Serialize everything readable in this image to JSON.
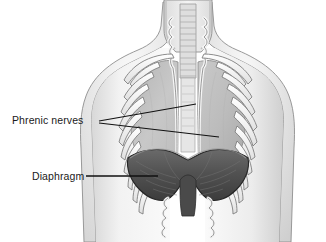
{
  "figure": {
    "background_color": "#ffffff",
    "width": 326,
    "height": 242
  },
  "labels": [
    {
      "id": "phrenic-nerves",
      "text": "Phrenic nerves",
      "x": 12,
      "y": 124,
      "color": "#1a1a1a"
    },
    {
      "id": "diaphragm",
      "text": "Diaphragm",
      "x": 32,
      "y": 180,
      "color": "#1a1a1a"
    }
  ],
  "leader_lines": [
    {
      "id": "phrenic-leader-upper",
      "points": "99,121 196,104",
      "color": "#111111"
    },
    {
      "id": "phrenic-leader-lower",
      "points": "99,123 219,137",
      "color": "#111111"
    },
    {
      "id": "diaphragm-leader",
      "points": "86,176 158,176",
      "color": "#111111"
    }
  ],
  "structures": {
    "body_outline": {
      "name": "torso-and-shoulders",
      "fill": "#f2f2f2",
      "stroke": "#8a8a8a"
    },
    "neck": {
      "name": "neck",
      "fill": "#ececec",
      "stroke": "#8a8a8a"
    },
    "trachea": {
      "name": "trachea",
      "fill": "#e4e4e4",
      "stroke": "#8f8f8f"
    },
    "lungs": {
      "name": "lungs",
      "fill": "#c4c4c4",
      "stroke": "#8a8a8a"
    },
    "ribs": {
      "name": "rib-cage",
      "fill": "#fbfbfb",
      "stroke": "#7d7d7d"
    },
    "clavicles": {
      "name": "clavicles",
      "fill": "#fbfbfb",
      "stroke": "#7d7d7d"
    },
    "diaphragm": {
      "name": "diaphragm-dome",
      "fill": "#585858",
      "stroke": "#2e2e2e"
    },
    "phrenic_nerves": {
      "name": "phrenic-nerve-strands",
      "fill": "#f4f4f4",
      "stroke": "#6f6f6f"
    },
    "crura": {
      "name": "diaphragm-crura",
      "fill": "#404040",
      "stroke": "#232323"
    }
  },
  "colors": {
    "background": "#ffffff",
    "lung_gray": "#c4c4c4",
    "diaphragm_dark": "#585858",
    "skin_light": "#f2f2f2",
    "outline": "#8a8a8a",
    "ink": "#111111"
  }
}
